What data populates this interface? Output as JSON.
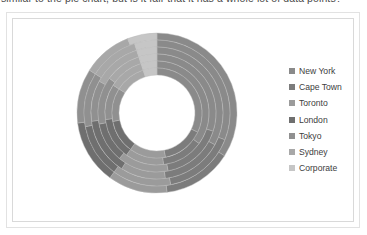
{
  "caption": {
    "text": "similar to the pie chart, but is it fair that it has a whole lot of data points?"
  },
  "legend": {
    "position": "right",
    "items": [
      {
        "label": "New York",
        "color": "#8a8a8a"
      },
      {
        "label": "Cape Town",
        "color": "#7c7c7c"
      },
      {
        "label": "Toronto",
        "color": "#9b9b9b"
      },
      {
        "label": "London",
        "color": "#6f6f6f"
      },
      {
        "label": "Tokyo",
        "color": "#909090"
      },
      {
        "label": "Sydney",
        "color": "#a8a8a8"
      },
      {
        "label": "Corporate",
        "color": "#c6c6c6"
      }
    ]
  },
  "chart_data": {
    "type": "pie",
    "variant": "multi-ring-doughnut",
    "title": "",
    "subtitle": "",
    "xlabel": "",
    "ylabel": "",
    "grid": false,
    "legend_position": "right",
    "center": {
      "x": 82,
      "y": 82
    },
    "outer_radius": 80,
    "inner_radius": 38,
    "ring_count": 6,
    "start_angle_deg": -90,
    "categories": [
      "New York",
      "Cape Town",
      "Toronto",
      "London",
      "Tokyo",
      "Sydney",
      "Corporate"
    ],
    "colors": [
      "#8a8a8a",
      "#7c7c7c",
      "#9b9b9b",
      "#6f6f6f",
      "#909090",
      "#a8a8a8",
      "#c6c6c6"
    ],
    "series": [
      {
        "name": "Ring 1 (outer)",
        "values": [
          34,
          14,
          12,
          13,
          11,
          10,
          6
        ]
      },
      {
        "name": "Ring 2",
        "values": [
          31,
          16,
          13,
          12,
          12,
          11,
          5
        ]
      },
      {
        "name": "Ring 3",
        "values": [
          33,
          15,
          11,
          14,
          10,
          12,
          5
        ]
      },
      {
        "name": "Ring 4",
        "values": [
          30,
          17,
          14,
          11,
          13,
          10,
          5
        ]
      },
      {
        "name": "Ring 5",
        "values": [
          35,
          13,
          12,
          13,
          11,
          11,
          5
        ]
      },
      {
        "name": "Ring 6 (inner)",
        "values": [
          32,
          15,
          13,
          12,
          12,
          11,
          5
        ]
      }
    ],
    "units": "percent"
  }
}
